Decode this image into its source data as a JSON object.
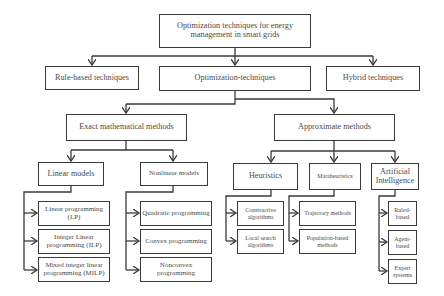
{
  "diagram": {
    "root": {
      "label": "Optimization techniques for energy management in smart grids"
    },
    "level1": [
      {
        "label": "Rule-based techniques"
      },
      {
        "label": "Optimization-techniques"
      },
      {
        "label": "Hybrid techniques"
      }
    ],
    "level2": [
      {
        "label": "Exact mathematical methods"
      },
      {
        "label": "Approximate methods"
      }
    ],
    "exact": {
      "linear": {
        "label": "Linear models",
        "children": [
          {
            "label": "Linear programming (LP)"
          },
          {
            "label": "Integer Linear programming (ILP)"
          },
          {
            "label": "Mixed integer linear programming (MILP)"
          }
        ]
      },
      "nonlinear": {
        "label": "Nonlinear models",
        "children": [
          {
            "label": "Quadratic programming"
          },
          {
            "label": "Convex programming"
          },
          {
            "label": "Nonconvex programming"
          }
        ]
      }
    },
    "approximate": {
      "heuristics": {
        "label": "Heuristics",
        "children": [
          {
            "label": "Constructive algorithms"
          },
          {
            "label": "Local search algorithms"
          }
        ]
      },
      "metaheuristics": {
        "label": "Mataheuristics",
        "children": [
          {
            "label": "Trajectory methods"
          },
          {
            "label": "Population-based methods"
          }
        ]
      },
      "ai": {
        "label": "Artificial Intelligence",
        "children": [
          {
            "label": "Ruled-based"
          },
          {
            "label": "Agent-based"
          },
          {
            "label": "Expert systems"
          }
        ]
      }
    }
  },
  "colors": {
    "line": "#3a3a3a",
    "text": "#4a4a4a",
    "background": "#ffffff"
  }
}
